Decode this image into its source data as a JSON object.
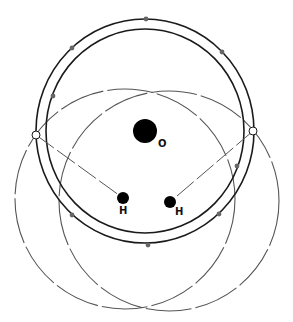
{
  "diagram": {
    "colors": {
      "ring": "#1a1a1a",
      "dashed_circle": "#555555",
      "dot": "#666666",
      "atom": "#000000",
      "background": "#ffffff"
    },
    "atoms": [
      {
        "id": "O",
        "label": "O",
        "cx": 145,
        "cy": 131,
        "r": 12,
        "label_x": 158,
        "label_y": 147
      },
      {
        "id": "H1",
        "label": "H",
        "cx": 123,
        "cy": 198,
        "r": 6,
        "label_x": 119,
        "label_y": 214
      },
      {
        "id": "H2",
        "label": "H",
        "cx": 170,
        "cy": 202,
        "r": 6,
        "label_x": 175,
        "label_y": 215
      }
    ],
    "rings": [
      {
        "id": "outer-ring",
        "cx": 145,
        "cy": 131,
        "rx": 109,
        "ry": 112
      },
      {
        "id": "inner-ring",
        "cx": 145,
        "cy": 131,
        "rx": 99,
        "ry": 102
      }
    ],
    "dashed_circles": [
      {
        "id": "left-dashed-circle",
        "cx": 125,
        "cy": 199,
        "r": 110
      },
      {
        "id": "right-dashed-circle",
        "cx": 169,
        "cy": 201,
        "r": 110
      }
    ],
    "open_nodes": [
      {
        "id": "left-open-node",
        "cx": 36,
        "cy": 135,
        "r": 4
      },
      {
        "id": "right-open-node",
        "cx": 253,
        "cy": 131,
        "r": 4
      }
    ],
    "dashed_lines": [
      {
        "id": "left-bond-line",
        "x1": 36,
        "y1": 135,
        "x2": 123,
        "y2": 198
      },
      {
        "id": "right-bond-line",
        "x1": 253,
        "y1": 131,
        "x2": 170,
        "y2": 202
      }
    ],
    "dots": [
      {
        "cx": 146,
        "cy": 19
      },
      {
        "cx": 72,
        "cy": 48
      },
      {
        "cx": 222,
        "cy": 52
      },
      {
        "cx": 53,
        "cy": 96
      },
      {
        "cx": 72,
        "cy": 215
      },
      {
        "cx": 219,
        "cy": 214
      },
      {
        "cx": 148,
        "cy": 245
      },
      {
        "cx": 237,
        "cy": 166
      }
    ]
  }
}
